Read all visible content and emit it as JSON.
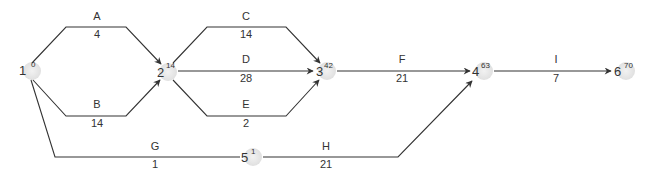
{
  "diagram": {
    "type": "activity-on-arrow network",
    "colors": {
      "line": "#333333",
      "node_fill": "#e6e6e6",
      "text": "#333333"
    },
    "nodes": [
      {
        "id": "1",
        "label": "1",
        "value": "0",
        "x": 30,
        "y": 70
      },
      {
        "id": "2",
        "label": "2",
        "value": "14",
        "x": 165,
        "y": 70
      },
      {
        "id": "3",
        "label": "3",
        "value": "42",
        "x": 325,
        "y": 70
      },
      {
        "id": "4",
        "label": "4",
        "value": "63",
        "x": 482,
        "y": 70
      },
      {
        "id": "5",
        "label": "5",
        "value": "1",
        "x": 253,
        "y": 157
      },
      {
        "id": "6",
        "label": "6",
        "value": "70",
        "x": 622,
        "y": 70
      }
    ],
    "edges": [
      {
        "id": "A",
        "label": "A",
        "duration": "4",
        "from": "1",
        "to": "2"
      },
      {
        "id": "B",
        "label": "B",
        "duration": "14",
        "from": "1",
        "to": "2"
      },
      {
        "id": "C",
        "label": "C",
        "duration": "14",
        "from": "2",
        "to": "3"
      },
      {
        "id": "D",
        "label": "D",
        "duration": "28",
        "from": "2",
        "to": "3"
      },
      {
        "id": "E",
        "label": "E",
        "duration": "2",
        "from": "2",
        "to": "3"
      },
      {
        "id": "F",
        "label": "F",
        "duration": "21",
        "from": "3",
        "to": "4"
      },
      {
        "id": "G",
        "label": "G",
        "duration": "1",
        "from": "1",
        "to": "5"
      },
      {
        "id": "H",
        "label": "H",
        "duration": "21",
        "from": "5",
        "to": "4"
      },
      {
        "id": "I",
        "label": "I",
        "duration": "7",
        "from": "4",
        "to": "6"
      }
    ]
  }
}
